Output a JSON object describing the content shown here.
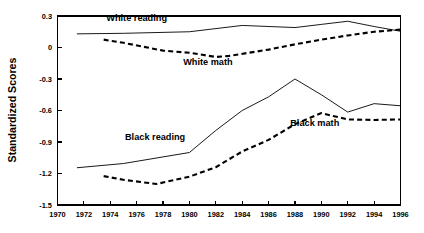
{
  "chart_data": {
    "type": "line",
    "title": "",
    "xlabel": "",
    "ylabel": "Standardized Scores",
    "xlim": [
      1970,
      1996
    ],
    "ylim": [
      -1.5,
      0.3
    ],
    "grid": false,
    "legend": "inline-annotations",
    "xticks": [
      1970,
      1972,
      1974,
      1976,
      1978,
      1980,
      1982,
      1984,
      1986,
      1988,
      1990,
      1992,
      1994,
      1996
    ],
    "xtick_labels": [
      "1970",
      "1972",
      "1974",
      "1976",
      "1978",
      "1980",
      "1982",
      "1984",
      "1986",
      "1988",
      "1990",
      "1992",
      "1994",
      "1996"
    ],
    "yticks": [
      0.3,
      0,
      -0.3,
      -0.6,
      -0.9,
      -1.2,
      -1.5
    ],
    "ytick_labels": [
      "0.3",
      "0",
      "-0.3",
      "-0.6",
      "-0.9",
      "-1.2",
      "-1.5"
    ],
    "series": [
      {
        "name": "White reading",
        "style": "solid",
        "label_x": 1976.0,
        "label_y": 0.255,
        "x": [
          1971.5,
          1975,
          1980,
          1984,
          1988,
          1990,
          1992,
          1994,
          1996
        ],
        "values": [
          0.13,
          0.135,
          0.15,
          0.21,
          0.19,
          0.22,
          0.25,
          0.2,
          0.155
        ]
      },
      {
        "name": "White math",
        "style": "dashed",
        "label_x": 1981.4,
        "label_y": -0.17,
        "x": [
          1973.5,
          1975,
          1978,
          1980,
          1982,
          1983,
          1986,
          1988,
          1990,
          1992,
          1994,
          1996
        ],
        "values": [
          0.075,
          0.045,
          -0.03,
          -0.05,
          -0.09,
          -0.08,
          -0.02,
          0.03,
          0.075,
          0.115,
          0.15,
          0.17
        ]
      },
      {
        "name": "Black reading",
        "style": "solid",
        "label_x": 1977.4,
        "label_y": -0.885,
        "x": [
          1971.5,
          1975,
          1980,
          1982,
          1984,
          1986,
          1988,
          1990,
          1992,
          1994,
          1996
        ],
        "values": [
          -1.145,
          -1.105,
          -1.0,
          -0.79,
          -0.6,
          -0.47,
          -0.3,
          -0.45,
          -0.615,
          -0.535,
          -0.555
        ]
      },
      {
        "name": "Black math",
        "style": "dashed",
        "label_x": 1989.5,
        "label_y": -0.745,
        "x": [
          1973.5,
          1975,
          1977.5,
          1980,
          1982,
          1984,
          1986,
          1988,
          1990,
          1992,
          1994,
          1996
        ],
        "values": [
          -1.225,
          -1.26,
          -1.3,
          -1.23,
          -1.14,
          -0.99,
          -0.88,
          -0.73,
          -0.625,
          -0.685,
          -0.69,
          -0.685
        ]
      }
    ]
  }
}
